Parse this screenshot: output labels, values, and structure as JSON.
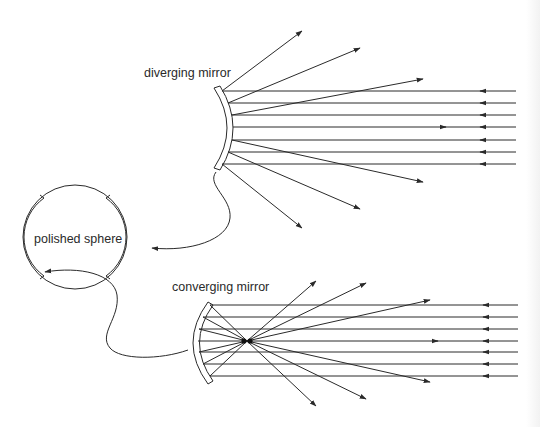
{
  "diagram": {
    "labels": {
      "diverging": "diverging mirror",
      "converging": "converging mirror",
      "sphere": "polished sphere"
    },
    "colors": {
      "line": "#2a2a2a",
      "background": "#ffffff"
    },
    "components": [
      {
        "id": "polished-sphere",
        "label": "polished sphere",
        "center": [
          75,
          237
        ],
        "radius": 52
      },
      {
        "id": "diverging-mirror",
        "label": "diverging mirror",
        "type": "convex",
        "span_y": [
          88,
          168
        ]
      },
      {
        "id": "converging-mirror",
        "label": "converging mirror",
        "type": "concave",
        "span_y": [
          302,
          385
        ]
      }
    ],
    "relations": [
      {
        "from": "diverging-mirror",
        "to": "polished-sphere",
        "meaning": "outer surface of sphere"
      },
      {
        "from": "polished-sphere",
        "to": "converging-mirror",
        "meaning": "inner surface of sphere"
      }
    ],
    "rays": {
      "diverging_incident_count": 7,
      "diverging_reflected_count": 6,
      "converging_incident_count": 7,
      "converging_reflected_count": 6
    }
  }
}
